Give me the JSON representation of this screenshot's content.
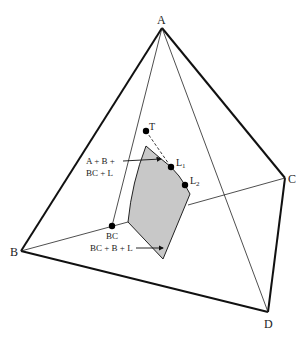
{
  "diagram": {
    "type": "tetrahedral phase diagram",
    "vertices": [
      {
        "id": "A",
        "label": "A",
        "x": 162,
        "y": 28
      },
      {
        "id": "B",
        "label": "B",
        "x": 21,
        "y": 251
      },
      {
        "id": "C",
        "label": "C",
        "x": 285,
        "y": 178
      },
      {
        "id": "D",
        "label": "D",
        "x": 268,
        "y": 312
      }
    ],
    "points": [
      {
        "id": "T",
        "label": "T",
        "x": 146,
        "y": 131
      },
      {
        "id": "L1",
        "label": "L",
        "sub": "1",
        "x": 171,
        "y": 167
      },
      {
        "id": "L2",
        "label": "L",
        "sub": "2",
        "x": 185,
        "y": 185
      },
      {
        "id": "BC",
        "label": "BC",
        "x": 112,
        "y": 226
      }
    ],
    "annotations": [
      {
        "id": "upper-field",
        "line1": "A + B +",
        "line2": "BC + L"
      },
      {
        "id": "lower-field",
        "line1": "BC + B + L"
      }
    ],
    "colors": {
      "edge": "#111111",
      "fill": "#c8c8c8",
      "background": "#ffffff"
    }
  }
}
